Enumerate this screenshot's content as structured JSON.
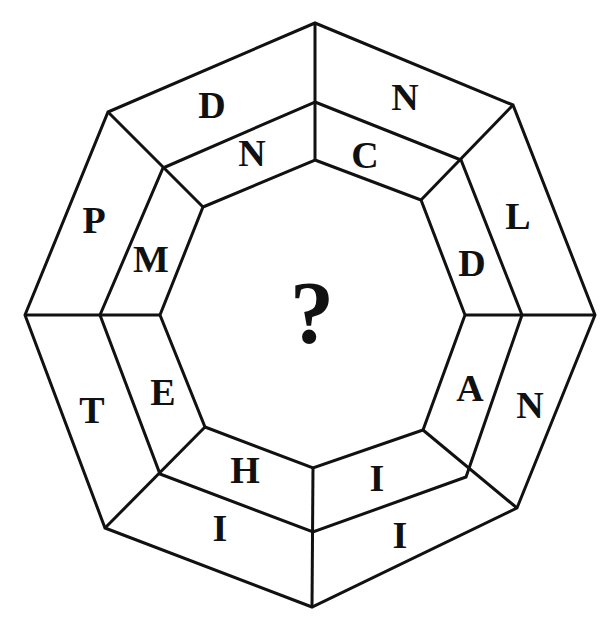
{
  "puzzle": {
    "center_symbol": "?",
    "outer_ring": [
      "N",
      "L",
      "N",
      "I",
      "I",
      "T",
      "P",
      "D"
    ],
    "inner_ring": [
      "C",
      "D",
      "A",
      "I",
      "H",
      "E",
      "M",
      "N"
    ],
    "segment_order": [
      "top-right",
      "right-upper",
      "right-lower",
      "bottom-right",
      "bottom-left",
      "left-lower",
      "left-upper",
      "top-left"
    ]
  }
}
